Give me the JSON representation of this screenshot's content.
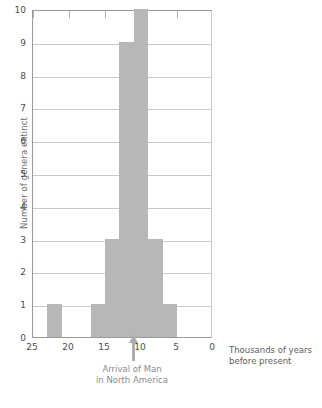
{
  "chart_data": {
    "type": "bar",
    "title": "",
    "subtitle": "",
    "xlabel": "Thousands of years before present",
    "ylabel": "Number of genera extinct",
    "xlim": [
      25,
      0
    ],
    "ylim": [
      0,
      10
    ],
    "x_axis_reversed": true,
    "grid": "horizontal",
    "legend": "none",
    "bin_width": 2,
    "bin_unit": "thousand years",
    "x_tick_labels": [
      "25",
      "20",
      "15",
      "10",
      "5",
      "0"
    ],
    "x_tick_values": [
      25,
      20,
      15,
      10,
      5,
      0
    ],
    "y_tick_labels": [
      "0",
      "1",
      "2",
      "3",
      "4",
      "5",
      "6",
      "7",
      "8",
      "9",
      "10"
    ],
    "y_tick_values": [
      0,
      1,
      2,
      3,
      4,
      5,
      6,
      7,
      8,
      9,
      10
    ],
    "top_tick_values": [
      25,
      20,
      15,
      10,
      5
    ],
    "bar_color": "#b7b7b7",
    "grid_color": "#c9c9cb",
    "axis_color": "#9a9a9c",
    "categories": [
      "25-23",
      "23-21",
      "21-19",
      "19-17",
      "17-15",
      "15-13",
      "13-11",
      "11-9",
      "9-7",
      "7-5",
      "5-3",
      "3-1"
    ],
    "bin_starts": [
      25,
      23,
      21,
      19,
      17,
      15,
      13,
      11,
      9,
      7,
      5,
      3
    ],
    "bin_ends": [
      23,
      21,
      19,
      17,
      15,
      13,
      11,
      9,
      7,
      5,
      3,
      1
    ],
    "values": [
      0,
      1,
      0,
      0,
      1,
      3,
      9,
      10,
      3,
      1,
      0,
      0
    ],
    "annotations": [
      {
        "name": "arrival-of-man",
        "line1": "Arrival of Man",
        "line2": "in North America",
        "x_value": 12,
        "marker": "up-arrow",
        "color": "#8b8b8d"
      }
    ]
  },
  "axis_caption": {
    "line1": "Thousands of years",
    "line2": "before present"
  },
  "y_axis": {
    "title": "Number of genera extinct"
  }
}
